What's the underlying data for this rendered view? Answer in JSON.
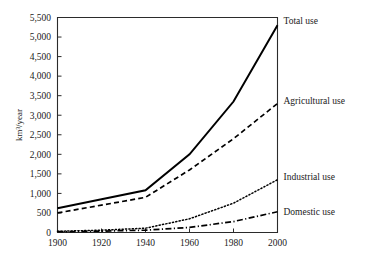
{
  "chart_data": {
    "type": "line",
    "title": "",
    "xlabel": "",
    "ylabel": "km³/year",
    "xlim": [
      1900,
      2000
    ],
    "ylim": [
      0,
      5500
    ],
    "grid": false,
    "legend_position": "right-inline-labels",
    "x": [
      1900,
      1920,
      1940,
      1960,
      1980,
      2000
    ],
    "xticks": [
      "1900",
      "1920",
      "1940",
      "1960",
      "1980",
      "2000"
    ],
    "yticks": [
      "0",
      "500",
      "1,000",
      "1,500",
      "2,000",
      "2,500",
      "3,000",
      "3,500",
      "4,000",
      "4,500",
      "5,000",
      "5,500"
    ],
    "ytick_values": [
      0,
      500,
      1000,
      1500,
      2000,
      2500,
      3000,
      3500,
      4000,
      4500,
      5000,
      5500
    ],
    "series": [
      {
        "name": "Total use",
        "label": "Total use",
        "style": "solid",
        "color": "#000000",
        "values": [
          620,
          850,
          1080,
          2000,
          3350,
          5300
        ]
      },
      {
        "name": "Agricultural use",
        "label": "Agricultural use",
        "style": "dashed",
        "color": "#000000",
        "values": [
          500,
          700,
          900,
          1600,
          2400,
          3300
        ]
      },
      {
        "name": "Industrial use",
        "label": "Industrial use",
        "style": "dotted",
        "color": "#000000",
        "values": [
          30,
          60,
          110,
          350,
          750,
          1350
        ]
      },
      {
        "name": "Domestic use",
        "label": "Domestic use",
        "style": "dash-dot",
        "color": "#000000",
        "values": [
          20,
          35,
          60,
          130,
          280,
          530
        ]
      }
    ]
  },
  "axes": {
    "y_axis_title": "km³/year"
  }
}
